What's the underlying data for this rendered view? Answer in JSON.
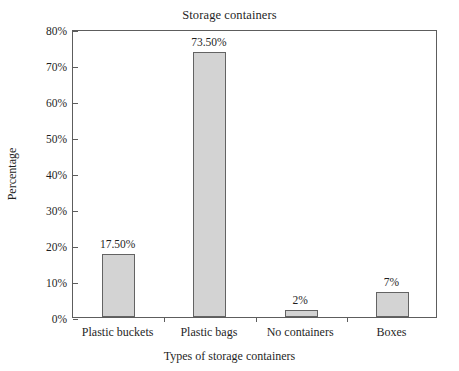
{
  "chart_data": {
    "type": "bar",
    "title": "Storage containers",
    "xlabel": "Types of storage containers",
    "ylabel": "Percentage",
    "categories": [
      "Plastic buckets",
      "Plastic bags",
      "No containers",
      "Boxes"
    ],
    "values": [
      17.5,
      73.5,
      2,
      7
    ],
    "value_labels": [
      "17.50%",
      "73.50%",
      "2%",
      "7%"
    ],
    "ylim": [
      0,
      80
    ],
    "ytick_values": [
      0,
      10,
      20,
      30,
      40,
      50,
      60,
      70,
      80
    ],
    "ytick_labels": [
      "0%",
      "10%",
      "20%",
      "30%",
      "40%",
      "50%",
      "60%",
      "70%",
      "80%"
    ],
    "grid": false,
    "legend": "none",
    "bar_fill_color": "#d3d3d3",
    "bar_border_color": "#636363",
    "axis_color": "#5d5d5d",
    "background_color": "#ffffff"
  }
}
